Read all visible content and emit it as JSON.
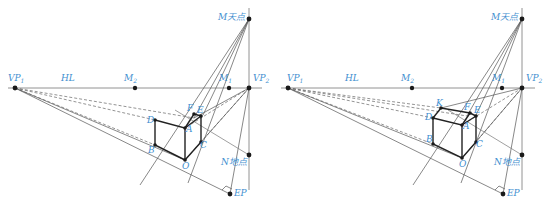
{
  "colors": {
    "label": "#3f8fd0",
    "line": "#555555",
    "point": "#1a1a1a",
    "edge": "#222222"
  },
  "panels": [
    {
      "id": "left",
      "labels": {
        "vp1": "VP",
        "vp1_sub": "1",
        "hl": "HL",
        "m2": "M",
        "m2_sub": "2",
        "m1": "M",
        "m1_sub": "1",
        "vp2": "VP",
        "vp2_sub": "2",
        "m_sky": "M天点",
        "n_ground": "N地点",
        "ep": "EP",
        "a": "A",
        "b": "B",
        "c": "C",
        "d": "D",
        "e": "E",
        "f": "F",
        "o": "O"
      }
    },
    {
      "id": "right",
      "labels": {
        "vp1": "VP",
        "vp1_sub": "1",
        "hl": "HL",
        "m2": "M",
        "m2_sub": "2",
        "m1": "M",
        "m1_sub": "1",
        "vp2": "VP",
        "vp2_sub": "2",
        "m_sky": "M天点",
        "n_ground": "N地点",
        "ep": "EP",
        "a": "A",
        "b": "B",
        "c": "C",
        "d": "D",
        "e": "E",
        "f": "F",
        "o": "O",
        "k": "K"
      }
    }
  ]
}
